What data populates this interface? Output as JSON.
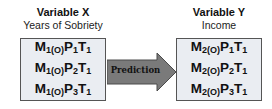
{
  "variable_x": {
    "title": "Variable X",
    "subtitle": "Years of Sobriety",
    "rows": [
      {
        "m": "M",
        "m_sub": "1(O)",
        "p": "P",
        "p_sub": "1",
        "t": "T",
        "t_sub": "1"
      },
      {
        "m": "M",
        "m_sub": "1(O)",
        "p": "P",
        "p_sub": "2",
        "t": "T",
        "t_sub": "1"
      },
      {
        "m": "M",
        "m_sub": "1(O)",
        "p": "P",
        "p_sub": "3",
        "t": "T",
        "t_sub": "1"
      }
    ]
  },
  "arrow": {
    "label": "Prediction",
    "color": "#7a7a7a"
  },
  "variable_y": {
    "title": "Variable Y",
    "subtitle": "Income",
    "rows": [
      {
        "m": "M",
        "m_sub": "2(O)",
        "p": "P",
        "p_sub": "1",
        "t": "T",
        "t_sub": "1"
      },
      {
        "m": "M",
        "m_sub": "2(O)",
        "p": "P",
        "p_sub": "2",
        "t": "T",
        "t_sub": "1"
      },
      {
        "m": "M",
        "m_sub": "2(O)",
        "p": "P",
        "p_sub": "3",
        "t": "T",
        "t_sub": "1"
      }
    ]
  },
  "colors": {
    "box_fill": "#eaedf2",
    "box_border": "#555555"
  }
}
